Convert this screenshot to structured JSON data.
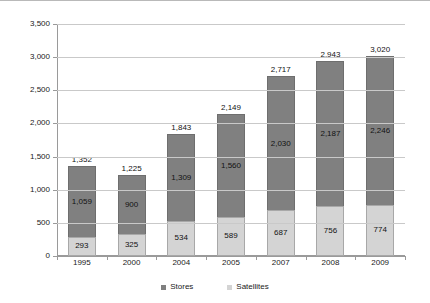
{
  "chart_data": {
    "type": "bar",
    "subtype": "stacked-bar",
    "title": "",
    "xlabel": "",
    "ylabel": "",
    "categories": [
      "1995",
      "2000",
      "2004",
      "2005",
      "2007",
      "2008",
      "2009"
    ],
    "series": [
      {
        "name": "Satellites",
        "color": "#d4d4d4",
        "values": [
          293,
          325,
          534,
          589,
          687,
          756,
          774
        ],
        "labels": [
          "293",
          "325",
          "534",
          "589",
          "687",
          "756",
          "774"
        ]
      },
      {
        "name": "Stores",
        "color": "#808080",
        "values": [
          1059,
          900,
          1309,
          1560,
          2030,
          2187,
          2246
        ],
        "labels": [
          "1,059",
          "900",
          "1,309",
          "1,560",
          "2,030",
          "2,187",
          "2,246"
        ]
      }
    ],
    "totals": [
      1352,
      1225,
      1843,
      2149,
      2717,
      2943,
      3020
    ],
    "total_labels": [
      "1,352",
      "1,225",
      "1,843",
      "2,149",
      "2,717",
      "2,943",
      "3,020"
    ],
    "ylim": [
      0,
      3500
    ],
    "y_ticks": [
      0,
      500,
      1000,
      1500,
      2000,
      2500,
      3000,
      3500
    ],
    "y_tick_labels": [
      "0",
      "500",
      "1,000",
      "1,500",
      "2,000",
      "2,500",
      "3,000",
      "3,500"
    ],
    "grid": true,
    "grid_color": "#c9c9c9",
    "axis_color": "#9a9a9a",
    "legend_position": "bottom-center",
    "stack_order_bottom_to_top": [
      "Satellites",
      "Stores"
    ]
  },
  "legend": {
    "items": [
      {
        "label": "Stores",
        "swatch": "legend-swatch-stores"
      },
      {
        "label": "Satellites",
        "swatch": "legend-swatch-satellites"
      }
    ]
  }
}
